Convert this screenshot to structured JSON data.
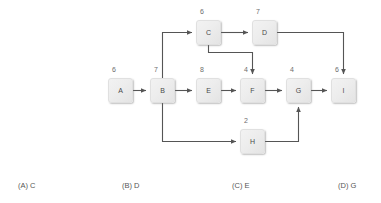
{
  "diagram": {
    "type": "activity-network-diagram",
    "line_color": "#555555",
    "node_fill": "#ededed",
    "text_color": "#4a4a4a",
    "nodes": [
      {
        "id": "A",
        "label": "A",
        "weight": "6",
        "x": 108,
        "y": 78,
        "weight_x": 112,
        "weight_y": 66
      },
      {
        "id": "B",
        "label": "B",
        "weight": "7",
        "x": 150,
        "y": 78,
        "weight_x": 154,
        "weight_y": 66
      },
      {
        "id": "C",
        "label": "C",
        "weight": "6",
        "x": 196,
        "y": 20,
        "weight_x": 200,
        "weight_y": 8
      },
      {
        "id": "D",
        "label": "D",
        "weight": "7",
        "x": 252,
        "y": 20,
        "weight_x": 256,
        "weight_y": 8
      },
      {
        "id": "E",
        "label": "E",
        "weight": "8",
        "x": 196,
        "y": 78,
        "weight_x": 200,
        "weight_y": 66
      },
      {
        "id": "F",
        "label": "F",
        "weight": "4",
        "x": 240,
        "y": 78,
        "weight_x": 244,
        "weight_y": 66
      },
      {
        "id": "G",
        "label": "G",
        "weight": "4",
        "x": 286,
        "y": 78,
        "weight_x": 290,
        "weight_y": 66
      },
      {
        "id": "H",
        "label": "H",
        "weight": "2",
        "x": 240,
        "y": 129,
        "weight_x": 244,
        "weight_y": 117
      },
      {
        "id": "I",
        "label": "I",
        "weight": "6",
        "x": 331,
        "y": 78,
        "weight_x": 335,
        "weight_y": 66
      }
    ],
    "edges": [
      {
        "from": "A",
        "to": "B",
        "path": "M133,90.5 L146,90.5",
        "arrow": "right"
      },
      {
        "from": "B",
        "to": "C",
        "path": "M162.5,78 L162.5,32.5 L192,32.5",
        "arrow": "right"
      },
      {
        "from": "B",
        "to": "E",
        "path": "M175,90.5 L192,90.5",
        "arrow": "right"
      },
      {
        "from": "B",
        "to": "H",
        "path": "M162.5,103 L162.5,141.5 L236,141.5",
        "arrow": "right"
      },
      {
        "from": "C",
        "to": "D",
        "path": "M221,32.5 L248,32.5",
        "arrow": "right"
      },
      {
        "from": "C",
        "to": "F",
        "path": "M208.5,45 L208.5,52.5 L252.5,52.5 L252.5,74",
        "arrow": "down"
      },
      {
        "from": "D",
        "to": "I",
        "path": "M277,32.5 L343.5,32.5 L343.5,74",
        "arrow": "down"
      },
      {
        "from": "E",
        "to": "F",
        "path": "M221,90.5 L236,90.5",
        "arrow": "right"
      },
      {
        "from": "F",
        "to": "G",
        "path": "M265,90.5 L282,90.5",
        "arrow": "right"
      },
      {
        "from": "G",
        "to": "I",
        "path": "M311,90.5 L327,90.5",
        "arrow": "right"
      },
      {
        "from": "H",
        "to": "G",
        "path": "M265,141.5 L298.5,141.5 L298.5,107",
        "arrow": "up"
      }
    ]
  },
  "options": [
    {
      "id": "option-a",
      "text": "(A) C",
      "x": 18,
      "y": 182
    },
    {
      "id": "option-b",
      "text": "(B) D",
      "x": 122,
      "y": 182
    },
    {
      "id": "option-c",
      "text": "(C) E",
      "x": 232,
      "y": 182
    },
    {
      "id": "option-d",
      "text": "(D) G",
      "x": 338,
      "y": 182
    }
  ]
}
